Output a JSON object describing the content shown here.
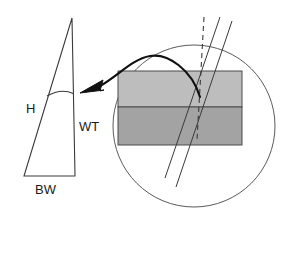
{
  "figure": {
    "background_color": "#ffffff",
    "width": 287,
    "height": 253,
    "labels": {
      "height": "H",
      "wall_thickness": "WT",
      "base_width": "BW"
    },
    "colors": {
      "stroke": "#333333",
      "dark_stroke": "#111111",
      "upper_band_fill": "#bdbdbd",
      "lower_band_fill": "#a3a3a3",
      "band_outline": "#4a4a4a",
      "circle_outline": "#555555"
    },
    "shapes": {
      "triangle": {
        "name": "trabecular-packet-triangle",
        "apex_x": 72,
        "apex_y": 18,
        "base_left_x": 24,
        "base_right_x": 75,
        "base_y": 176,
        "arc_y": 95
      },
      "circle": {
        "name": "magnification-circle",
        "cx": 194,
        "cy": 126,
        "r": 81
      },
      "upper_band": {
        "name": "upper-lamellar-band",
        "x": 118,
        "y": 71,
        "width": 124,
        "height": 36
      },
      "lower_band": {
        "name": "lower-lamellar-band",
        "x": 118,
        "y": 107,
        "width": 124,
        "height": 38
      },
      "dashed_line": {
        "name": "vertical-reference-dashed-line",
        "x1": 204,
        "y1": 17,
        "x2": 197,
        "y2": 140
      },
      "slant_line_1": {
        "name": "cement-line-left",
        "x1": 220,
        "y1": 17,
        "x2": 165,
        "y2": 178
      },
      "slant_line_2": {
        "name": "cement-line-right",
        "x1": 232,
        "y1": 21,
        "x2": 176,
        "y2": 187
      },
      "arrow": {
        "name": "magnification-callout-arrow",
        "tail_x": 200,
        "tail_y": 97,
        "tip_x": 82,
        "tip_y": 93
      }
    }
  }
}
